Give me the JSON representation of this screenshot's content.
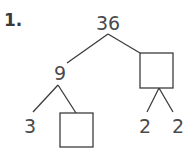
{
  "problem": {
    "number_label": "1."
  },
  "factor_tree": {
    "root": "36",
    "left_child": "9",
    "right_child": "",
    "left_left": "3",
    "left_right": "",
    "right_left": "2",
    "right_right": "2"
  },
  "colors": {
    "text": "#4a4a4a",
    "lines": "#3c3c3c",
    "background": "#ffffff"
  }
}
